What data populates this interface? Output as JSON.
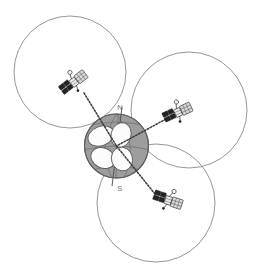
{
  "figure": {
    "title": "Satellite constellation coverage diagram",
    "description": "Three satellites in orbit around the Earth, each projecting a dashed communication beam toward the globe; each satellite has a large circular ground-coverage area.",
    "background_color": "#ffffff"
  },
  "colors": {
    "coverage_stroke": "#8a8a8a",
    "globe_fill": "#9d9d9d",
    "globe_stroke": "#6d6d6d",
    "footprint_fill": "#fcfcfc",
    "footprint_stroke": "#5e5e5e",
    "beam_stroke": "#3a3a3a",
    "label_text": "#6e6e6e",
    "satellite_dark": "#242424",
    "satellite_panel": "#d9d9d9"
  },
  "globe": {
    "label": "Earth",
    "center_x": 116.5,
    "center_y": 146,
    "radius": 32,
    "poles": {
      "north": {
        "label": "N",
        "x": 120,
        "y": 108
      },
      "south": {
        "label": "S",
        "x": 120,
        "y": 189
      }
    }
  },
  "coverage_areas": [
    {
      "name": "coverage-northwest",
      "center_x": 70,
      "center_y": 72,
      "radius": 56
    },
    {
      "name": "coverage-east",
      "center_x": 189,
      "center_y": 110,
      "radius": 58
    },
    {
      "name": "coverage-south",
      "center_x": 156,
      "center_y": 203,
      "radius": 59
    }
  ],
  "satellites": [
    {
      "name": "satellite-northwest",
      "x": 73,
      "y": 83,
      "rotation": -38,
      "beam_from_x": 84,
      "beam_from_y": 93,
      "beam_to_x": 116.5,
      "beam_to_y": 146
    },
    {
      "name": "satellite-east",
      "x": 177,
      "y": 113,
      "rotation": -25,
      "beam_from_x": 166,
      "beam_from_y": 119,
      "beam_to_x": 116.5,
      "beam_to_y": 146
    },
    {
      "name": "satellite-south",
      "x": 167,
      "y": 200,
      "rotation": 18,
      "beam_from_x": 155,
      "beam_from_y": 194,
      "beam_to_x": 116.5,
      "beam_to_y": 146
    }
  ],
  "footprints": [
    {
      "name": "footprint-upper-left"
    },
    {
      "name": "footprint-lower-left"
    },
    {
      "name": "footprint-upper-right"
    },
    {
      "name": "footprint-lower-right"
    }
  ]
}
